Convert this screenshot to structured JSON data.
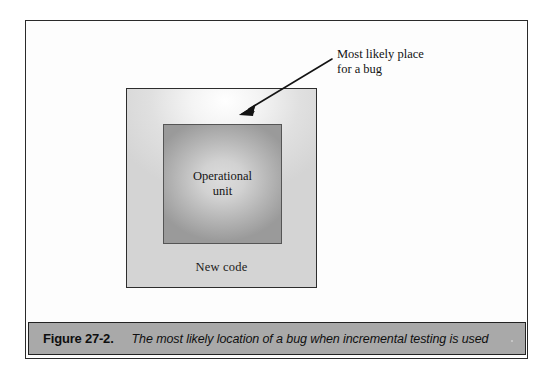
{
  "figure": {
    "outer_box": {
      "label": "New code",
      "fill_light": "#d5d5d5",
      "border_color": "#2d2d2d"
    },
    "inner_box": {
      "label": "Operational\nunit",
      "fill_mid": "#a8a8a8",
      "border_color": "#555555"
    },
    "annotation": {
      "text": "Most likely place\nfor a bug",
      "arrow_color": "#141414"
    }
  },
  "caption": {
    "figure_number": "Figure 27-2.",
    "text": "The most likely location of a bug when incremental testing is used",
    "bar_color": "#a9a9a9"
  },
  "page": {
    "background": "#ffffff",
    "frame_color": "#2a2a2a"
  }
}
